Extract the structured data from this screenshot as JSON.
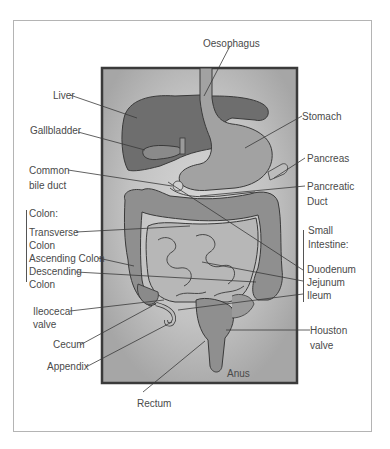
{
  "diagram": {
    "labels": {
      "oesophagus": "Oesophagus",
      "liver": "Liver",
      "gallbladder": "Gallbladder",
      "stomach": "Stomach",
      "pancreas": "Pancreas",
      "common_bile_duct_1": "Common",
      "common_bile_duct_2": "bile duct",
      "pancreatic_duct_1": "Pancreatic",
      "pancreatic_duct_2": "Duct",
      "colon_heading": "Colon:",
      "transverse_1": "Transverse",
      "transverse_2": "Colon",
      "ascending": "Ascending Colon",
      "descending_1": "Descending",
      "descending_2": "Colon",
      "small_intestine_1": "Small",
      "small_intestine_2": "Intestine:",
      "duodenum": "Duodenum",
      "jejunum": "Jejunum",
      "ileum": "Ileum",
      "ileocecal_1": "Ileocecal",
      "ileocecal_2": "valve",
      "cecum": "Cecum",
      "appendix": "Appendix",
      "houston_1": "Houston",
      "houston_2": "valve",
      "anus": "Anus",
      "rectum": "Rectum"
    },
    "colors": {
      "panel_bg": "#a9a9a9",
      "panel_glow": "#c9c9c9",
      "organ_dark": "#6e6e6e",
      "organ_mid": "#8f8f8f",
      "organ_light": "#b3b3b3",
      "outline": "#3a3a3a",
      "label_text": "#4a4a4a"
    }
  }
}
